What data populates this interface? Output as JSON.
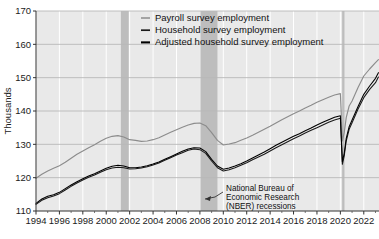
{
  "chart_data": {
    "type": "line",
    "title": "",
    "xlabel": "",
    "ylabel": "Thousands",
    "xlim": [
      1994,
      2023.3
    ],
    "ylim": [
      110,
      170
    ],
    "ytick_labels": [
      "110",
      "120",
      "130",
      "140",
      "150",
      "160",
      "170"
    ],
    "ytick_values": [
      110,
      120,
      130,
      140,
      150,
      160,
      170
    ],
    "xtick_labels": [
      "1994",
      "1996",
      "1998",
      "2000",
      "2002",
      "2004",
      "2006",
      "2008",
      "2010",
      "2012",
      "2014",
      "2016",
      "2018",
      "2020",
      "2022"
    ],
    "xtick_values": [
      1994,
      1996,
      1998,
      2000,
      2002,
      2004,
      2006,
      2008,
      2010,
      2012,
      2014,
      2016,
      2018,
      2020,
      2022
    ],
    "grid": true,
    "legend_position": "top-right",
    "colors": {
      "payroll": "#8c8c8c",
      "household": "#1a1a1a",
      "adjusted_household": "#000000",
      "recession_band": "#bdbdbd",
      "plot_background": "#e9e9e9",
      "gridline_horizontal": "#b8b8b8",
      "gridline_vertical": "#ffffff",
      "axis": "#333333"
    },
    "series": [
      {
        "name": "Payroll survey employment",
        "color": "#8c8c8c",
        "x": [
          1994.0,
          1994.5,
          1995.0,
          1995.5,
          1996.0,
          1996.5,
          1997.0,
          1997.5,
          1998.0,
          1998.5,
          1999.0,
          1999.5,
          2000.0,
          2000.5,
          2001.0,
          2001.5,
          2002.0,
          2002.5,
          2003.0,
          2003.5,
          2004.0,
          2004.5,
          2005.0,
          2005.5,
          2006.0,
          2006.5,
          2007.0,
          2007.5,
          2008.0,
          2008.5,
          2009.0,
          2009.5,
          2010.0,
          2010.5,
          2011.0,
          2011.5,
          2012.0,
          2012.5,
          2013.0,
          2013.5,
          2014.0,
          2014.5,
          2015.0,
          2015.5,
          2016.0,
          2016.5,
          2017.0,
          2017.5,
          2018.0,
          2018.5,
          2019.0,
          2019.5,
          2020.0,
          2020.17,
          2020.33,
          2020.5,
          2020.75,
          2021.0,
          2021.5,
          2022.0,
          2022.5,
          2023.0,
          2023.25
        ],
        "values": [
          119.8,
          121.0,
          122.0,
          122.8,
          123.6,
          124.6,
          125.8,
          127.0,
          128.0,
          129.0,
          129.9,
          130.9,
          131.8,
          132.4,
          132.6,
          132.2,
          131.4,
          131.2,
          130.9,
          131.0,
          131.4,
          132.0,
          132.8,
          133.6,
          134.4,
          135.1,
          135.8,
          136.3,
          136.4,
          135.6,
          133.5,
          131.2,
          129.8,
          130.1,
          130.5,
          131.2,
          131.9,
          132.7,
          133.6,
          134.5,
          135.4,
          136.4,
          137.4,
          138.3,
          139.2,
          140.0,
          140.9,
          141.7,
          142.6,
          143.4,
          144.1,
          144.8,
          145.2,
          131.0,
          133.5,
          138.0,
          141.5,
          143.0,
          147.0,
          150.5,
          152.6,
          154.5,
          155.4
        ]
      },
      {
        "name": "Household survey employment",
        "color": "#1a1a1a",
        "x": [
          1994.0,
          1994.5,
          1995.0,
          1995.5,
          1996.0,
          1996.5,
          1997.0,
          1997.5,
          1998.0,
          1998.5,
          1999.0,
          1999.5,
          2000.0,
          2000.5,
          2001.0,
          2001.5,
          2002.0,
          2002.5,
          2003.0,
          2003.5,
          2004.0,
          2004.5,
          2005.0,
          2005.5,
          2006.0,
          2006.5,
          2007.0,
          2007.5,
          2008.0,
          2008.5,
          2009.0,
          2009.5,
          2010.0,
          2010.5,
          2011.0,
          2011.5,
          2012.0,
          2012.5,
          2013.0,
          2013.5,
          2014.0,
          2014.5,
          2015.0,
          2015.5,
          2016.0,
          2016.5,
          2017.0,
          2017.5,
          2018.0,
          2018.5,
          2019.0,
          2019.5,
          2020.0,
          2020.17,
          2020.33,
          2020.5,
          2020.75,
          2021.0,
          2021.5,
          2022.0,
          2022.5,
          2023.0,
          2023.25
        ],
        "values": [
          112.0,
          113.2,
          114.0,
          114.5,
          115.2,
          116.3,
          117.4,
          118.4,
          119.3,
          120.1,
          120.8,
          121.6,
          122.4,
          122.9,
          123.1,
          123.0,
          122.6,
          122.7,
          122.9,
          123.3,
          123.8,
          124.4,
          125.2,
          126.0,
          126.8,
          127.5,
          128.2,
          128.6,
          128.4,
          127.3,
          125.0,
          123.0,
          122.0,
          122.4,
          123.0,
          123.7,
          124.5,
          125.4,
          126.2,
          127.0,
          128.0,
          129.0,
          129.9,
          130.8,
          131.7,
          132.5,
          133.4,
          134.2,
          135.0,
          135.8,
          136.6,
          137.3,
          137.8,
          124.0,
          126.5,
          131.0,
          134.5,
          136.5,
          140.5,
          144.0,
          146.5,
          148.5,
          150.2
        ]
      },
      {
        "name": "Adjusted household survey employment",
        "color": "#000000",
        "x": [
          1994.0,
          1994.5,
          1995.0,
          1995.5,
          1996.0,
          1996.5,
          1997.0,
          1997.5,
          1998.0,
          1998.5,
          1999.0,
          1999.5,
          2000.0,
          2000.5,
          2001.0,
          2001.5,
          2002.0,
          2002.5,
          2003.0,
          2003.5,
          2004.0,
          2004.5,
          2005.0,
          2005.5,
          2006.0,
          2006.5,
          2007.0,
          2007.5,
          2008.0,
          2008.5,
          2009.0,
          2009.5,
          2010.0,
          2010.5,
          2011.0,
          2011.5,
          2012.0,
          2012.5,
          2013.0,
          2013.5,
          2014.0,
          2014.5,
          2015.0,
          2015.5,
          2016.0,
          2016.5,
          2017.0,
          2017.5,
          2018.0,
          2018.5,
          2019.0,
          2019.5,
          2020.0,
          2020.17,
          2020.33,
          2020.5,
          2020.75,
          2021.0,
          2021.5,
          2022.0,
          2022.5,
          2023.0,
          2023.25
        ],
        "values": [
          112.3,
          113.6,
          114.4,
          114.9,
          115.6,
          116.7,
          117.8,
          118.8,
          119.7,
          120.5,
          121.2,
          122.0,
          122.8,
          123.4,
          123.7,
          123.5,
          123.0,
          123.0,
          123.2,
          123.6,
          124.1,
          124.7,
          125.5,
          126.3,
          127.1,
          127.9,
          128.6,
          129.0,
          128.9,
          127.8,
          125.5,
          123.5,
          122.5,
          122.9,
          123.5,
          124.2,
          125.0,
          125.9,
          126.8,
          127.7,
          128.7,
          129.7,
          130.6,
          131.5,
          132.4,
          133.2,
          134.1,
          134.9,
          135.8,
          136.6,
          137.4,
          138.1,
          138.6,
          124.8,
          127.3,
          131.8,
          135.3,
          137.3,
          141.3,
          145.0,
          147.5,
          149.8,
          151.5
        ]
      }
    ],
    "recessions": [
      {
        "start": 2001.25,
        "end": 2001.92
      },
      {
        "start": 2007.95,
        "end": 2009.5
      },
      {
        "start": 2020.15,
        "end": 2020.35
      }
    ],
    "annotation": {
      "lines": [
        "National Bureau of",
        "Economic Research",
        "(NBER) recessions"
      ],
      "has_arrow": true
    },
    "legend": [
      {
        "label": "Payroll survey employment",
        "color": "#8c8c8c"
      },
      {
        "label": "Household survey employment",
        "color": "#1a1a1a"
      },
      {
        "label": "Adjusted household survey employment",
        "color": "#000000"
      }
    ]
  }
}
